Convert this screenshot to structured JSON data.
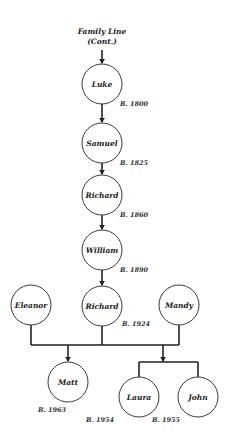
{
  "title": {
    "line1": "Family Line",
    "line2": "(Cont.)"
  },
  "born_prefix": "B.",
  "people": [
    {
      "id": "luke",
      "name": "Luke",
      "born": "1800"
    },
    {
      "id": "samuel",
      "name": "Samuel",
      "born": "1825"
    },
    {
      "id": "richard-1860",
      "name": "Richard",
      "born": "1860"
    },
    {
      "id": "william",
      "name": "William",
      "born": "1890"
    },
    {
      "id": "richard-1924",
      "name": "Richard",
      "born": "1924"
    },
    {
      "id": "eleanor",
      "name": "Eleanor",
      "born": null
    },
    {
      "id": "mandy",
      "name": "Mandy",
      "born": null
    },
    {
      "id": "matt",
      "name": "Matt",
      "born": "1963"
    },
    {
      "id": "laura",
      "name": "Laura",
      "born": "1954"
    },
    {
      "id": "john",
      "name": "John",
      "born": "1955"
    }
  ],
  "relations": {
    "lineage": [
      "luke",
      "samuel",
      "richard-1860",
      "william",
      "richard-1924"
    ],
    "unions": [
      {
        "partners": [
          "eleanor",
          "richard-1924"
        ],
        "children": [
          "matt"
        ]
      },
      {
        "partners": [
          "richard-1924",
          "mandy"
        ],
        "children": [
          "laura",
          "john"
        ]
      }
    ]
  },
  "colors": {
    "line": "#222222",
    "circle_stroke": "#3a3a3a",
    "background": "#ffffff"
  }
}
